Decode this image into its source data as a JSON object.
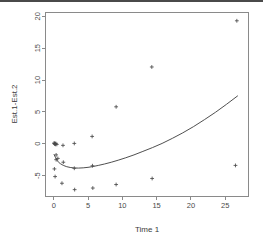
{
  "figure": {
    "background": "#ffffff",
    "frame_color": "#8a8a8a",
    "point_color": "#4a4a4a",
    "curve_color": "#3b3b3b",
    "top_band_color": "#4a4a4a",
    "point_symbol": "plus"
  },
  "chart_data": {
    "type": "scatter",
    "title": "",
    "xlabel": "Time 1",
    "ylabel": "Est.1-Est.2",
    "xlim": [
      -1.2,
      28.4
    ],
    "ylim": [
      -8.2,
      20.6
    ],
    "xticks": [
      0,
      5,
      10,
      15,
      20,
      25
    ],
    "xticklabels": [
      "0",
      "5",
      "10",
      "15",
      "20",
      "25"
    ],
    "yticks": [
      -5,
      0,
      5,
      10,
      15,
      20
    ],
    "yticklabels": [
      "-5",
      "0",
      "5",
      "10",
      "15",
      "20"
    ],
    "grid": false,
    "legend": null,
    "series": [
      {
        "name": "observations",
        "marker": "+",
        "x": [
          0.05,
          0.1,
          0.15,
          0.2,
          0.25,
          0.3,
          0.35,
          0.45,
          0.1,
          0.2,
          0.35,
          0.6,
          1.2,
          1.35,
          1.4,
          3.0,
          3.0,
          3.05,
          5.6,
          5.65,
          5.7,
          9.1,
          9.1,
          14.3,
          14.35,
          26.5,
          26.7
        ],
        "y": [
          0.1,
          0.05,
          -0.05,
          0.0,
          -0.1,
          0.05,
          -1.75,
          -0.1,
          -3.95,
          -5.15,
          -2.5,
          -2.3,
          -6.2,
          -0.25,
          -2.9,
          0.05,
          -3.85,
          -7.2,
          1.15,
          -3.45,
          -6.95,
          5.8,
          -6.4,
          12.05,
          -5.45,
          -3.4,
          19.3
        ]
      },
      {
        "name": "fitted-smooth-curve",
        "type": "line",
        "x": [
          0.05,
          0.25,
          0.45,
          0.7,
          1.0,
          1.4,
          1.9,
          2.4,
          3.0,
          3.6,
          4.3,
          5.0,
          5.7,
          6.5,
          7.4,
          8.4,
          9.4,
          10.5,
          11.7,
          13.0,
          14.4,
          15.8,
          17.3,
          18.8,
          20.4,
          22.0,
          23.6,
          25.2,
          26.8
        ],
        "y": [
          -1.7,
          -2.15,
          -2.55,
          -2.9,
          -3.15,
          -3.4,
          -3.6,
          -3.72,
          -3.8,
          -3.82,
          -3.78,
          -3.7,
          -3.58,
          -3.4,
          -3.18,
          -2.9,
          -2.58,
          -2.2,
          -1.75,
          -1.2,
          -0.6,
          0.05,
          0.85,
          1.7,
          2.7,
          3.8,
          4.95,
          6.2,
          7.5
        ]
      }
    ]
  }
}
